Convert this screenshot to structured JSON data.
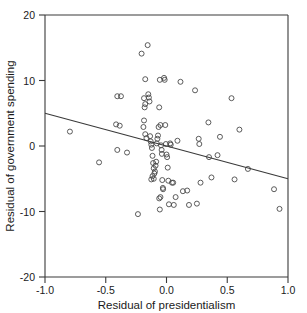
{
  "chart_data": {
    "type": "scatter",
    "title": "",
    "xlabel": "Residual of presidentialism",
    "ylabel": "Residual of government spending",
    "xlim": [
      -1.0,
      1.0
    ],
    "ylim": [
      -20,
      20
    ],
    "xticks": [
      -1.0,
      -0.5,
      0.0,
      0.5,
      1.0
    ],
    "xtick_labels": [
      "-1.0",
      "-0.5",
      "0.0",
      "0.5",
      "1.0"
    ],
    "yticks": [
      -20,
      -10,
      0,
      10,
      20
    ],
    "ytick_labels": [
      "-20",
      "-10",
      "0",
      "10",
      "20"
    ],
    "grid": false,
    "legend": "none",
    "marker": "open-circle",
    "points": [
      [
        -0.795,
        2.2
      ],
      [
        -0.555,
        -2.5
      ],
      [
        -0.405,
        7.6
      ],
      [
        -0.375,
        7.6
      ],
      [
        -0.415,
        3.3
      ],
      [
        -0.385,
        3.1
      ],
      [
        -0.405,
        -0.6
      ],
      [
        -0.325,
        -1.0
      ],
      [
        -0.235,
        -10.4
      ],
      [
        -0.205,
        14.1
      ],
      [
        -0.155,
        15.4
      ],
      [
        -0.175,
        10.2
      ],
      [
        -0.185,
        7.3
      ],
      [
        -0.175,
        6.4
      ],
      [
        -0.18,
        5.9
      ],
      [
        -0.185,
        3.9
      ],
      [
        -0.19,
        2.9
      ],
      [
        -0.175,
        1.8
      ],
      [
        -0.165,
        1.2
      ],
      [
        -0.15,
        7.9
      ],
      [
        -0.145,
        7.4
      ],
      [
        -0.14,
        6.8
      ],
      [
        -0.135,
        1.5
      ],
      [
        -0.13,
        0.7
      ],
      [
        -0.125,
        0.2
      ],
      [
        -0.12,
        -0.3
      ],
      [
        -0.115,
        -1.5
      ],
      [
        -0.11,
        -2.6
      ],
      [
        -0.105,
        -3.4
      ],
      [
        -0.1,
        -4.2
      ],
      [
        -0.115,
        -4.6
      ],
      [
        -0.125,
        -5.1
      ],
      [
        -0.105,
        -5.0
      ],
      [
        -0.095,
        -3.9
      ],
      [
        -0.09,
        -3.0
      ],
      [
        -0.085,
        -2.4
      ],
      [
        -0.08,
        0.4
      ],
      [
        -0.075,
        1.1
      ],
      [
        -0.07,
        1.6
      ],
      [
        -0.065,
        2.9
      ],
      [
        -0.06,
        5.9
      ],
      [
        -0.055,
        10.1
      ],
      [
        -0.05,
        3.2
      ],
      [
        -0.045,
        0.1
      ],
      [
        -0.04,
        -0.6
      ],
      [
        -0.038,
        -1.2
      ],
      [
        -0.035,
        -5.2
      ],
      [
        -0.03,
        -6.4
      ],
      [
        -0.028,
        -6.6
      ],
      [
        -0.05,
        -7.8
      ],
      [
        -0.06,
        -8.0
      ],
      [
        -0.055,
        -9.7
      ],
      [
        -0.02,
        10.4
      ],
      [
        -0.015,
        10.1
      ],
      [
        -0.01,
        3.2
      ],
      [
        -0.005,
        0.3
      ],
      [
        0.0,
        -1.3
      ],
      [
        0.005,
        -1.7
      ],
      [
        0.01,
        -3.3
      ],
      [
        0.015,
        -5.3
      ],
      [
        0.02,
        -8.9
      ],
      [
        0.03,
        0.4
      ],
      [
        0.035,
        0.2
      ],
      [
        0.045,
        -5.6
      ],
      [
        0.055,
        -5.6
      ],
      [
        0.06,
        -9.0
      ],
      [
        0.075,
        -7.8
      ],
      [
        0.09,
        0.8
      ],
      [
        0.115,
        9.8
      ],
      [
        0.135,
        -6.9
      ],
      [
        0.17,
        -6.8
      ],
      [
        0.185,
        -9.0
      ],
      [
        0.235,
        8.5
      ],
      [
        0.25,
        -8.8
      ],
      [
        0.265,
        1.1
      ],
      [
        0.27,
        0.3
      ],
      [
        0.28,
        -5.6
      ],
      [
        0.345,
        3.6
      ],
      [
        0.35,
        -1.7
      ],
      [
        0.37,
        -4.8
      ],
      [
        0.42,
        -1.4
      ],
      [
        0.44,
        1.4
      ],
      [
        0.535,
        7.3
      ],
      [
        0.56,
        -5.1
      ],
      [
        0.6,
        2.5
      ],
      [
        0.67,
        -3.5
      ],
      [
        0.885,
        -6.6
      ],
      [
        0.93,
        -9.6
      ]
    ],
    "regression_line": {
      "x_start": -1.0,
      "y_start": 5.0,
      "x_end": 1.0,
      "y_end": -5.0,
      "slope": -5.0,
      "intercept": 0.0
    }
  }
}
